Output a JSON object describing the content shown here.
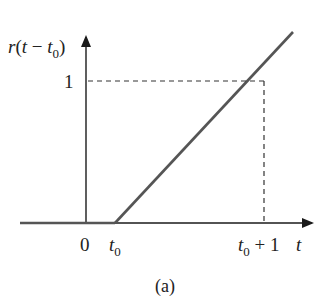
{
  "diagram": {
    "type": "ramp-function-plot",
    "y_axis_label": {
      "func": "r",
      "open": "(",
      "var": "t",
      "minus": " − ",
      "shift": "t",
      "shift_sub": "0",
      "close": ")"
    },
    "y_tick_label": "1",
    "x_axis_label": "t",
    "x_tick_labels": {
      "origin": "0",
      "t0_main": "t",
      "t0_sub": "0",
      "t0p1_main": "t",
      "t0p1_sub": "0",
      "t0p1_rest": " + 1"
    },
    "caption": "(a)",
    "colors": {
      "axis": "#1a1a1a",
      "ramp": "#555555",
      "dashed": "#333333",
      "text": "#222222"
    }
  }
}
